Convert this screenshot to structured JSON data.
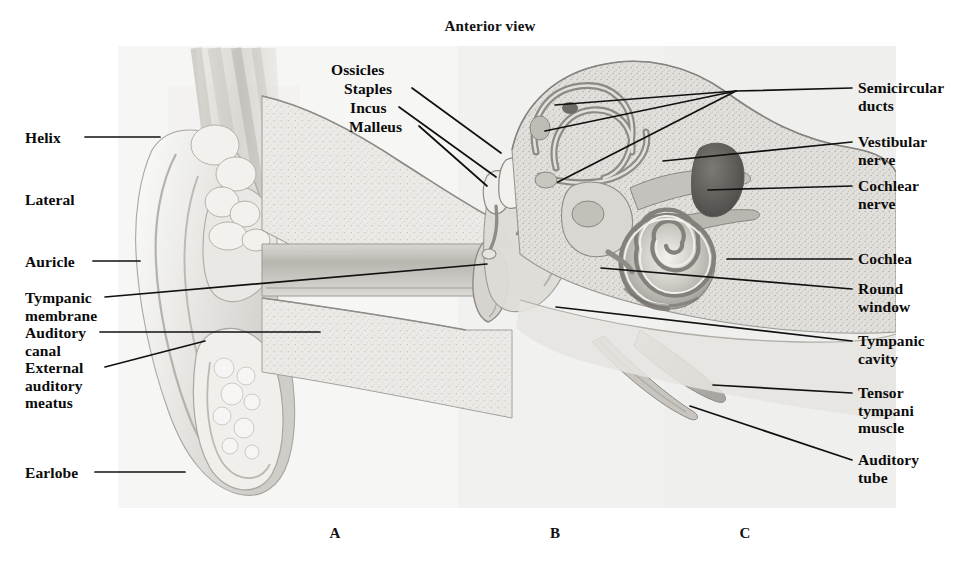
{
  "figure": {
    "title": "Anterior view",
    "domain_note": "Labeled anatomical illustration of the human ear in three sectional regions",
    "panel_letters": [
      {
        "label": "A",
        "x": 335,
        "y": 525
      },
      {
        "label": "B",
        "x": 555,
        "y": 525
      },
      {
        "label": "C",
        "x": 745,
        "y": 525
      }
    ]
  },
  "labels_left": [
    {
      "id": "helix",
      "text": "Helix",
      "x": 25,
      "y": 129,
      "leader": {
        "x1": 85,
        "y1": 137,
        "x2": 160,
        "y2": 137
      }
    },
    {
      "id": "lateral",
      "text": "Lateral",
      "x": 25,
      "y": 191,
      "leader": null
    },
    {
      "id": "auricle",
      "text": "Auricle",
      "x": 25,
      "y": 253,
      "leader": {
        "x1": 93,
        "y1": 261,
        "x2": 140,
        "y2": 261
      }
    },
    {
      "id": "tympanic-membrane",
      "text": "Tympanic\nmembrane",
      "x": 25,
      "y": 289,
      "leader": {
        "x1": 105,
        "y1": 297,
        "x2": 487,
        "y2": 264
      }
    },
    {
      "id": "auditory-canal",
      "text": "Auditory\ncanal",
      "x": 25,
      "y": 324,
      "leader": {
        "x1": 100,
        "y1": 332,
        "x2": 320,
        "y2": 332
      }
    },
    {
      "id": "external-auditory-meatus",
      "text": "External\nauditory\nmeatus",
      "x": 25,
      "y": 359,
      "leader": {
        "x1": 105,
        "y1": 367,
        "x2": 205,
        "y2": 341
      }
    },
    {
      "id": "earlobe",
      "text": "Earlobe",
      "x": 25,
      "y": 464,
      "leader": {
        "x1": 95,
        "y1": 472,
        "x2": 185,
        "y2": 472
      }
    }
  ],
  "labels_center": [
    {
      "id": "ossicles",
      "text": "Ossicles",
      "x": 331,
      "y": 61,
      "leader": null
    },
    {
      "id": "staples",
      "text": "Staples",
      "x": 344,
      "y": 80,
      "leader": {
        "x1": 412,
        "y1": 88,
        "x2": 501,
        "y2": 153
      }
    },
    {
      "id": "incus",
      "text": "Incus",
      "x": 350,
      "y": 99,
      "leader": {
        "x1": 399,
        "y1": 107,
        "x2": 496,
        "y2": 177
      }
    },
    {
      "id": "malleus",
      "text": "Malleus",
      "x": 349,
      "y": 118,
      "leader": {
        "x1": 419,
        "y1": 126,
        "x2": 487,
        "y2": 186
      }
    }
  ],
  "labels_right": [
    {
      "id": "semicircular-ducts",
      "text": "Semicircular\nducts",
      "x": 858,
      "y": 79,
      "leaders": [
        {
          "x1": 852,
          "y1": 88,
          "x2": 736,
          "y2": 91
        },
        {
          "x1": 736,
          "y1": 91,
          "x2": 545,
          "y2": 131
        },
        {
          "x1": 736,
          "y1": 91,
          "x2": 555,
          "y2": 105
        },
        {
          "x1": 736,
          "y1": 91,
          "x2": 558,
          "y2": 182
        }
      ]
    },
    {
      "id": "vestibular-nerve",
      "text": "Vestibular\nnerve",
      "x": 858,
      "y": 133,
      "leaders": [
        {
          "x1": 852,
          "y1": 142,
          "x2": 663,
          "y2": 161
        }
      ]
    },
    {
      "id": "cochlear-nerve",
      "text": "Cochlear\nnerve",
      "x": 858,
      "y": 177,
      "leaders": [
        {
          "x1": 852,
          "y1": 186,
          "x2": 708,
          "y2": 190
        }
      ]
    },
    {
      "id": "cochlea",
      "text": "Cochlea",
      "x": 858,
      "y": 250,
      "leaders": [
        {
          "x1": 852,
          "y1": 259,
          "x2": 727,
          "y2": 259
        }
      ]
    },
    {
      "id": "round-window",
      "text": "Round\nwindow",
      "x": 858,
      "y": 280,
      "leaders": [
        {
          "x1": 852,
          "y1": 289,
          "x2": 601,
          "y2": 268
        }
      ]
    },
    {
      "id": "tympanic-cavity",
      "text": "Tympanic\ncavity",
      "x": 858,
      "y": 332,
      "leaders": [
        {
          "x1": 852,
          "y1": 341,
          "x2": 556,
          "y2": 307
        }
      ]
    },
    {
      "id": "tensor-tympani-muscle",
      "text": "Tensor\ntympani\nmuscle",
      "x": 858,
      "y": 384,
      "leaders": [
        {
          "x1": 852,
          "y1": 393,
          "x2": 713,
          "y2": 385
        }
      ]
    },
    {
      "id": "auditory-tube",
      "text": "Auditory\ntube",
      "x": 858,
      "y": 451,
      "leaders": [
        {
          "x1": 852,
          "y1": 460,
          "x2": 690,
          "y2": 406
        }
      ]
    }
  ],
  "colors": {
    "ink": "#0b0b0b",
    "leader": "#111111",
    "paper": "#ffffff",
    "panel_a_bg": "#f5f5f3",
    "panel_b_bg": "#f0f0ee",
    "panel_c_bg": "#eeeeec",
    "tone_light": "#e8e7e4",
    "tone_mid": "#cfcdc8",
    "tone_dark": "#a8a5a0",
    "tone_darker": "#8a8782",
    "tone_deepest": "#6b6965"
  }
}
